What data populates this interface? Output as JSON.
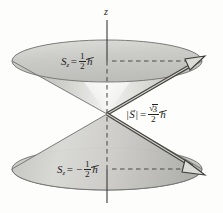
{
  "figure": {
    "axis": {
      "name": "z-axis",
      "label": "z"
    },
    "labels": {
      "sz_upper": {
        "symbol": "S",
        "subscript": "z",
        "equals": "=",
        "sign": "",
        "numerator": "1",
        "denominator": "2",
        "unit": "h",
        "plain_text": "S_z = 1/2 ħ"
      },
      "sz_lower": {
        "symbol": "S",
        "subscript": "z",
        "equals": "=",
        "sign": "−",
        "numerator": "1",
        "denominator": "2",
        "unit": "h",
        "plain_text": "S_z = -1/2 ħ"
      },
      "s_magnitude": {
        "bar_left": "|",
        "symbol": "S",
        "vector_arrow": "→",
        "bar_right": "|",
        "equals": "=",
        "radical": "√",
        "radicand": "3",
        "denominator": "2",
        "unit": "h",
        "plain_text": "|S| = (sqrt(3)/2) ħ"
      }
    },
    "vectors": [
      {
        "name": "spin-up-vector",
        "direction": "upper-right",
        "style": "double-line-open-arrowhead"
      },
      {
        "name": "spin-down-vector",
        "direction": "lower-right",
        "style": "double-line-open-arrowhead"
      }
    ],
    "cones": [
      {
        "name": "upper-cone",
        "orientation": "opening-upward"
      },
      {
        "name": "lower-cone",
        "orientation": "opening-downward"
      }
    ],
    "colors": {
      "background": "#fdfdfc",
      "ink": "#232323",
      "cone_fill_light": "#efefee",
      "cone_fill_mid": "#c9c9c7",
      "cone_fill_dark": "#a9a9a6",
      "outline": "#6f6f6d",
      "dashed": "#4a4a49"
    }
  }
}
